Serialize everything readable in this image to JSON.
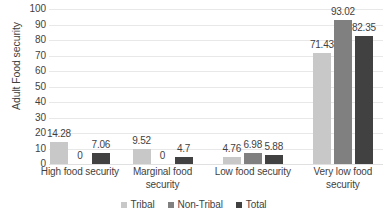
{
  "chart_data": {
    "type": "bar",
    "title": "",
    "xlabel": "",
    "ylabel": "Adult Food security",
    "ylim": [
      0,
      100
    ],
    "ytick_step": 10,
    "yticks": [
      "100",
      "90",
      "80",
      "70",
      "60",
      "50",
      "40",
      "30",
      "20",
      "10",
      "0"
    ],
    "grid": true,
    "legend_position": "bottom",
    "categories": [
      "High food security",
      "Marginal food security",
      "Low food security",
      "Very low food security"
    ],
    "series": [
      {
        "name": "Tribal",
        "color": "#c8c8c8",
        "values": [
          14.28,
          9.52,
          4.76,
          71.43
        ]
      },
      {
        "name": "Non-Tribal",
        "color": "#808080",
        "values": [
          0,
          0,
          6.98,
          93.02
        ]
      },
      {
        "name": "Total",
        "color": "#414141",
        "values": [
          7.06,
          4.7,
          5.88,
          82.35
        ]
      }
    ],
    "data_labels": [
      [
        "14.28",
        "0",
        "7.06"
      ],
      [
        "9.52",
        "0",
        "4.7"
      ],
      [
        "4.76",
        "6.98",
        "5.88"
      ],
      [
        "71.43",
        "93.02",
        "82.35"
      ]
    ]
  }
}
